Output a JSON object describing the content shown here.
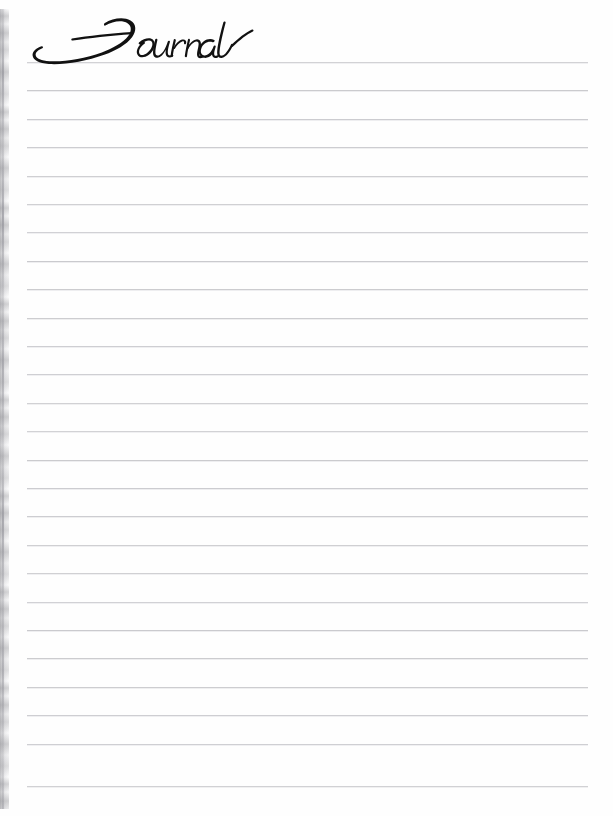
{
  "page": {
    "width": 613,
    "height": 816,
    "background_color": "#fefefe",
    "kind": "lined-journal-page"
  },
  "title": {
    "text": "Journal",
    "style": "script-calligraphy",
    "color": "#111111",
    "left": 28,
    "top": 20,
    "right": 192,
    "bottom": 68
  },
  "ruled_lines": {
    "count": 26,
    "color": "#c9c9cd",
    "thickness_px": 1,
    "first_y": 62,
    "spacing_y": 28.4,
    "x_start": 27,
    "x_end": 588,
    "y_positions": [
      62,
      90.4,
      118.8,
      147.2,
      175.6,
      204,
      232.4,
      260.8,
      289.2,
      317.6,
      346,
      374.4,
      402.8,
      431.2,
      459.6,
      488,
      516.4,
      544.8,
      573.2,
      601.6,
      630,
      658.4,
      686.8,
      715.2,
      743.6,
      786
    ]
  },
  "scan_edge": {
    "description": "mottled gray scan shadow along left binding edge",
    "color": "#8c8c94",
    "x_start": 0,
    "x_end": 9,
    "y_start": 9,
    "y_end": 809
  },
  "right_margin": {
    "x_start": 588,
    "x_end": 613,
    "color": "#ffffff"
  }
}
